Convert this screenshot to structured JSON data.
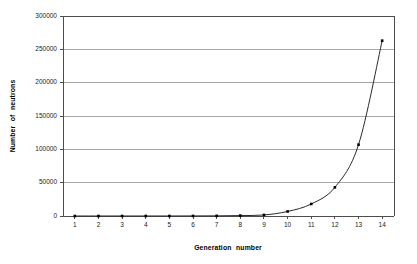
{
  "chart_data": {
    "type": "line",
    "title": "",
    "xlabel": "Generation  number",
    "ylabel": "Number  of  neutrons",
    "categories": [
      1,
      2,
      3,
      4,
      5,
      6,
      7,
      8,
      9,
      10,
      11,
      12,
      13,
      14
    ],
    "x_tick_labels": [
      "1",
      "2",
      "3",
      "4",
      "5",
      "6",
      "7",
      "8",
      "9",
      "10",
      "11",
      "12",
      "13",
      "14"
    ],
    "y_tick_labels": [
      "0",
      "50000",
      "100000",
      "150000",
      "200000",
      "250000",
      "300000"
    ],
    "y_ticks": [
      0,
      50000,
      100000,
      150000,
      200000,
      250000,
      300000
    ],
    "values": [
      1,
      3,
      7,
      17,
      42,
      103,
      254,
      626,
      1540,
      6800,
      18000,
      43000,
      107000,
      263000
    ],
    "ylim": [
      0,
      300000
    ],
    "xlim_categories": [
      1,
      14
    ],
    "grid": "horizontal",
    "legend": "none",
    "marker": "square",
    "marker_color": "#000000",
    "line_color": "#2b2b2b",
    "gridline_color": "#a6a6a6",
    "axis_color": "#4d4d4d",
    "background_color": "#ffffff"
  }
}
